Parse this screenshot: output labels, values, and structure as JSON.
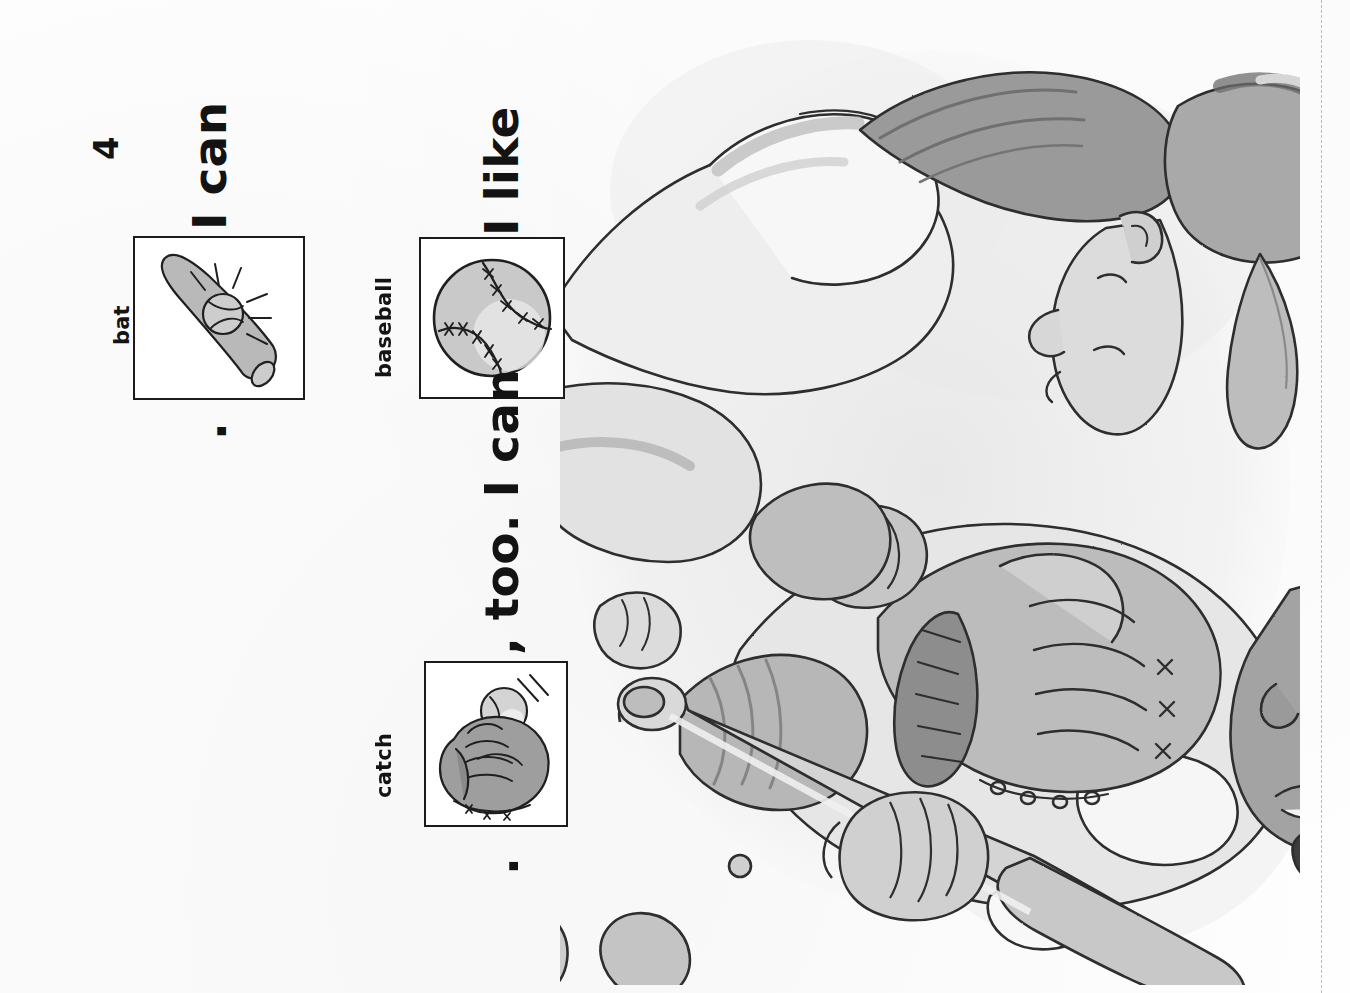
{
  "page": {
    "number": "4",
    "orientation": "rotated-90-ccw",
    "background_color": "#fefefe",
    "ink_color": "#131313"
  },
  "sentences": [
    {
      "id": "sentence-2",
      "parts": [
        {
          "type": "text",
          "value": "I can"
        },
        {
          "type": "picture",
          "label": "bat",
          "icon": "baseball-bat-icon"
        },
        {
          "type": "text",
          "value": "."
        }
      ]
    },
    {
      "id": "sentence-1",
      "parts": [
        {
          "type": "text",
          "value": "I like"
        },
        {
          "type": "picture",
          "label": "baseball",
          "icon": "baseball-icon"
        },
        {
          "type": "text",
          "value": ", too. I can"
        },
        {
          "type": "picture",
          "label": "catch",
          "icon": "glove-catch-icon"
        },
        {
          "type": "text",
          "value": "."
        }
      ]
    }
  ],
  "text_runs": {
    "i_can_left": "I can",
    "period_left": ".",
    "i_like": "I like",
    "comma_too_i_can": ", too. I can",
    "period_right": "."
  },
  "picture_labels": {
    "bat": "bat",
    "baseball": "baseball",
    "catch": "catch"
  },
  "illustration": {
    "name": "two-children-playing-baseball",
    "description": "A girl wearing a cap with a ponytail and a boy wearing a cap; the boy holds a baseball glove and a baseball bat.",
    "elements": [
      "girl-with-ponytail-and-cap",
      "boy-with-cap",
      "baseball-glove",
      "baseball-bat"
    ],
    "palette": {
      "outline": "#2a2a2a",
      "light_gray": "#dcdcdc",
      "mid_gray": "#b4b4b4",
      "dark_gray": "#8d8d8d",
      "deep_gray": "#6a6a6a",
      "shadow": "#efefef"
    }
  },
  "trim_line": {
    "name": "dashed-trim-guide",
    "color": "#5a5a5a"
  }
}
